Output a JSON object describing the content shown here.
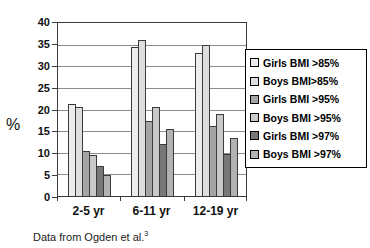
{
  "chart_data": {
    "type": "bar",
    "title": "",
    "ylabel": "%",
    "categories": [
      "2-5 yr",
      "6-11 yr",
      "12-19 yr"
    ],
    "series": [
      {
        "name": "Girls BMI >85%",
        "color": "#ECECEC",
        "values": [
          21.3,
          34.4,
          33.0
        ]
      },
      {
        "name": "Boys BMI>85%",
        "color": "#DEDEDE",
        "values": [
          20.5,
          36.0,
          35.0
        ]
      },
      {
        "name": "Girls BMI >95%",
        "color": "#A5A5A5",
        "values": [
          10.4,
          17.4,
          16.2
        ]
      },
      {
        "name": "Boys BMI >95%",
        "color": "#C9C9C9",
        "values": [
          9.4,
          20.5,
          18.9
        ]
      },
      {
        "name": "Girls BMI >97%",
        "color": "#787878",
        "values": [
          7.0,
          12.0,
          9.7
        ]
      },
      {
        "name": "Boys BMI >97%",
        "color": "#B2B2B2",
        "values": [
          4.9,
          15.5,
          13.5
        ]
      }
    ],
    "ylim": [
      0,
      40
    ],
    "yticks": [
      40,
      35,
      30,
      25,
      20,
      15,
      10,
      5,
      0
    ],
    "grid": true,
    "legend_position": "right",
    "axis_color": "#3a3a3a",
    "gridline_color": "#8c8c8c"
  },
  "caption": {
    "text": "Data from Ogden et al.",
    "superscript": "3"
  }
}
